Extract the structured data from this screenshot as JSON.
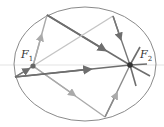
{
  "diagram": {
    "labels": {
      "focus1": "F",
      "focus1_sub": "1",
      "focus2": "F",
      "focus2_sub": "2"
    },
    "colors": {
      "ellipse": "#8a8a8a",
      "ray_dark": "#6e6e6e",
      "ray_light": "#b5b5b5",
      "focus_dot": "#555555",
      "axis": "#d8d8d8"
    },
    "foci": [
      {
        "name": "F1",
        "x": 33,
        "y": 66
      },
      {
        "name": "F2",
        "x": 130,
        "y": 65
      }
    ]
  }
}
